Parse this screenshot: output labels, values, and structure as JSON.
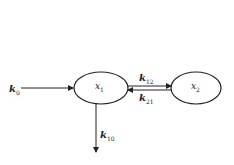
{
  "diagram": {
    "type": "two-compartment pharmacokinetic model",
    "nodes": [
      {
        "id": "x1",
        "label": "x",
        "sub": "1"
      },
      {
        "id": "x2",
        "label": "x",
        "sub": "2"
      }
    ],
    "edges": [
      {
        "id": "k0",
        "from": "input",
        "to": "x1",
        "label": "k",
        "sub": "0"
      },
      {
        "id": "k12",
        "from": "x1",
        "to": "x2",
        "label": "k",
        "sub": "12"
      },
      {
        "id": "k21",
        "from": "x2",
        "to": "x1",
        "label": "k",
        "sub": "21"
      },
      {
        "id": "k10",
        "from": "x1",
        "to": "output",
        "label": "k",
        "sub": "10"
      }
    ],
    "colors": {
      "stroke": "#222222",
      "background": "#ffffff"
    }
  }
}
